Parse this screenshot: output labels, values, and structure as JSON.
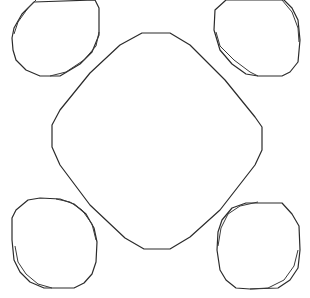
{
  "diagram": {
    "width": 310,
    "height": 298,
    "background": "#ffffff",
    "stroke_color": "#2b2b2b",
    "shapes": [
      {
        "name": "center-rounded-square",
        "type": "rounded-diamond",
        "points": "142,33 170,33 190,45 225,80 255,117 262,127 262,150 255,165 220,210 190,237 170,249 144,249 125,238 90,205 60,165 52,147 52,125 60,110 90,73 120,45"
      },
      {
        "name": "oval-top-left",
        "type": "double-outline-oval",
        "outer": "12,38 14,28 22,14 34,2 95,0 99,8 99,35 92,52 80,64 60,76 40,76 26,70 16,60 13,50",
        "inner": "14,34 18,22 28,8 36,0 M99,32 96,46 84,60 66,72 50,76"
      },
      {
        "name": "oval-top-right",
        "type": "double-outline-oval",
        "outer": "215,10 226,0 284,0 292,8 298,20 300,40 298,62 290,72 282,76 258,76 246,74 232,64 220,50 214,30",
        "inner": "216,32 220,46 234,60 250,72 258,76 M282,0 292,12 298,28 299,42"
      },
      {
        "name": "oval-bottom-left",
        "type": "double-outline-oval",
        "outer": "12,218 16,210 28,200 40,198 60,199 74,204 86,214 94,228 97,242 96,262 92,274 84,283 74,288 44,288 30,282 20,272 14,260 12,240",
        "inner": "15,246 18,262 26,274 38,284 52,288 M56,199 70,202 82,210 92,224 96,240"
      },
      {
        "name": "oval-bottom-right",
        "type": "double-outline-oval",
        "outer": "217,250 218,232 222,220 232,208 246,203 282,203 292,214 299,226 300,250 298,268 290,280 278,288 250,289 236,288 226,280 220,270",
        "inner": "218,246 221,228 228,214 240,206 258,202 M298,250 294,266 284,280 268,288 250,289"
      }
    ]
  }
}
